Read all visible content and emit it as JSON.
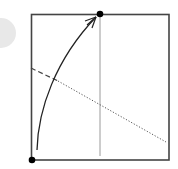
{
  "diagram": {
    "type": "folding-step",
    "badge": {
      "shape": "circle",
      "color": "#e8e8e8",
      "partially_visible": true
    },
    "square": {
      "x": 31,
      "y": 14,
      "width": 138,
      "height": 146,
      "stroke": "#444444"
    },
    "points": [
      {
        "name": "bottom-left-corner-dot",
        "x": 32,
        "y": 160,
        "color": "#000000"
      },
      {
        "name": "top-edge-midpoint-dot",
        "x": 100,
        "y": 14,
        "color": "#000000"
      }
    ],
    "lines": [
      {
        "name": "vertical-crease",
        "style": "solid-thin",
        "x1": 100,
        "y1": 14,
        "x2": 100,
        "y2": 156,
        "color": "#999999"
      },
      {
        "name": "valley-fold-dashed",
        "style": "dashed",
        "x1": 31,
        "y1": 68,
        "x2": 58,
        "y2": 81,
        "color": "#444444"
      },
      {
        "name": "mountain-fold-dotted",
        "style": "dotted",
        "x1": 58,
        "y1": 81,
        "x2": 166,
        "y2": 142,
        "color": "#555555"
      }
    ],
    "arrow": {
      "name": "fold-direction-arrow",
      "from": [
        37,
        150
      ],
      "to": [
        96,
        17
      ],
      "head": "open-chevron",
      "color": "#222222"
    }
  }
}
